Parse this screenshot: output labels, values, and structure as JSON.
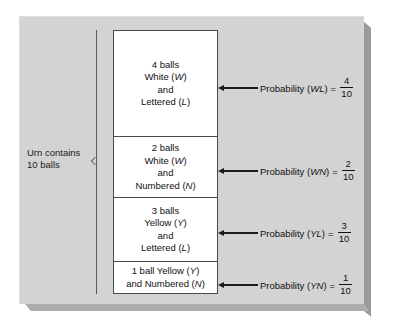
{
  "diagram": {
    "urn_label": {
      "line1": "Urn contains",
      "line2": "10 balls"
    },
    "groups": [
      {
        "id": "white-lettered",
        "lines": [
          "4 balls",
          "White (W)",
          "and",
          "Lettered (L)"
        ],
        "count": 4,
        "probability": {
          "label": "Probability (WL)",
          "equals": "=",
          "numerator": "4",
          "denominator": "10"
        }
      },
      {
        "id": "white-numbered",
        "lines": [
          "2 balls",
          "White (W)",
          "and",
          "Numbered (N)"
        ],
        "count": 2,
        "probability": {
          "label": "Probability (WN)",
          "equals": "=",
          "numerator": "2",
          "denominator": "10"
        }
      },
      {
        "id": "yellow-lettered",
        "lines": [
          "3 balls",
          "Yellow (Y)",
          "and",
          "Lettered (L)"
        ],
        "count": 3,
        "probability": {
          "label": "Probability (YL)",
          "equals": "=",
          "numerator": "3",
          "denominator": "10"
        }
      },
      {
        "id": "yellow-numbered",
        "lines": [
          "1 ball Yellow (Y)",
          "and Numbered (N)"
        ],
        "count": 1,
        "probability": {
          "label": "Probability (YN)",
          "equals": "=",
          "numerator": "1",
          "denominator": "10"
        }
      }
    ],
    "colors": {
      "panel_background": "#d3d3d3",
      "box_fill": "#ffffff",
      "box_border": "#4a4a4a",
      "text": "#111111",
      "shadow": "#9a9a9a"
    }
  }
}
